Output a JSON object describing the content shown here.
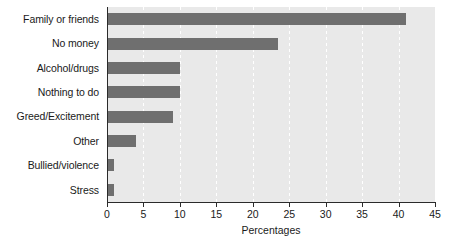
{
  "chart_data": {
    "type": "bar",
    "orientation": "horizontal",
    "title": "",
    "xlabel": "Percentages",
    "ylabel": "",
    "categories": [
      "Family or friends",
      "No money",
      "Alcohol/drugs",
      "Nothing to do",
      "Greed/Excitement",
      "Other",
      "Bullied/violence",
      "Stress"
    ],
    "values": [
      41,
      23.5,
      10,
      10,
      9,
      4,
      1,
      1
    ],
    "xlim": [
      0,
      45
    ],
    "xticks": [
      0,
      5,
      10,
      15,
      20,
      25,
      30,
      35,
      40,
      45
    ],
    "xticklabels": [
      "0",
      "5",
      "10",
      "15",
      "20",
      "25",
      "30",
      "35",
      "40",
      "45"
    ],
    "grid": "vertical-dashed-white",
    "legend": null,
    "colors": {
      "bar": "#6f6f6f",
      "plot_background": "#e9e9e9",
      "figure_background": "#ffffff",
      "gridline": "#ffffff",
      "axis": "#2b2b2b",
      "text": "#1a1a1a"
    }
  }
}
